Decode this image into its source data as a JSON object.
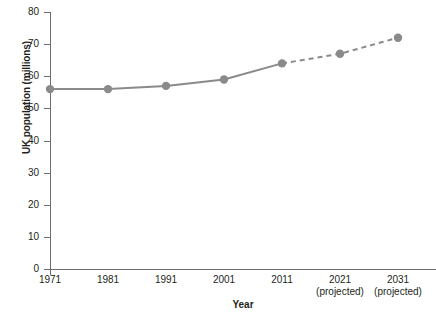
{
  "chart_data": {
    "type": "line",
    "title": "",
    "xlabel": "Year",
    "ylabel": "UK population (millions)",
    "categories": [
      "1971",
      "1981",
      "1991",
      "2001",
      "2011",
      "2021",
      "2031"
    ],
    "category_sublabels": [
      "",
      "",
      "",
      "",
      "",
      "(projected)",
      "(projected)"
    ],
    "values": [
      56,
      56,
      57,
      59,
      64,
      67,
      72
    ],
    "series": [
      {
        "name": "UK population (millions)",
        "values": [
          56,
          56,
          57,
          59,
          64,
          67,
          72
        ],
        "actual_points": 5,
        "projected_points": 2,
        "color": "#8a8a8a",
        "line_style_actual": "solid",
        "line_style_projected": "dashed",
        "marker": "circle"
      }
    ],
    "ylim": [
      0,
      80
    ],
    "yticks": [
      0,
      10,
      20,
      30,
      40,
      50,
      60,
      70,
      80
    ],
    "ytick_labels": [
      "0",
      "10",
      "20",
      "30",
      "40",
      "50",
      "60",
      "70",
      "80"
    ],
    "grid": false,
    "legend": "none",
    "axis_color": "#6d6e71"
  },
  "colors": {
    "series": "#8a8a8a",
    "axis": "#6d6e71",
    "text": "#231f20",
    "background": "#ffffff"
  }
}
